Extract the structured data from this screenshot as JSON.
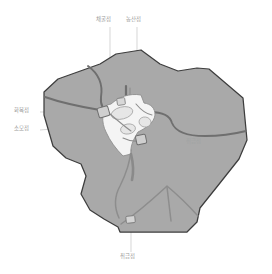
{
  "figure": {
    "type": "regional-map-diagram",
    "title": "",
    "background_color": "#ffffff"
  },
  "colors": {
    "land_fill": "#a9a9a9",
    "land_stroke": "#3d3d3d",
    "urban_fill": "#f2f2f2",
    "urban_stroke": "#8f8f8f",
    "road_major": "#6f6f6f",
    "road_minor": "#8a8a8a",
    "label_text": "#9a9a9a",
    "leader_line": "#bdbdbd"
  },
  "labels": {
    "top_left": "채굴점",
    "top_right": "농산점",
    "left_upper": "화목점",
    "left_lower": "소모점",
    "right": "취급점",
    "bottom": "취급점"
  },
  "leader_lines": [
    {
      "name": "top-left-leader",
      "from": [
        110,
        27
      ],
      "to": [
        110,
        97
      ]
    },
    {
      "name": "top-right-leader",
      "from": [
        137,
        27
      ],
      "to": [
        137,
        100
      ]
    },
    {
      "name": "left-upper-leader",
      "from": [
        40,
        112
      ],
      "to": [
        102,
        112
      ]
    },
    {
      "name": "left-lower-leader",
      "from": [
        40,
        130
      ],
      "to": [
        110,
        125
      ]
    },
    {
      "name": "right-leader",
      "from": [
        184,
        142
      ],
      "to": [
        150,
        142
      ]
    },
    {
      "name": "bottom-leader",
      "from": [
        131,
        252
      ],
      "to": [
        131,
        222
      ]
    }
  ],
  "geometry": {
    "land_outline": "M 53,146 L 44,115 L 44,92 L 58,79 L 100,64 L 116,54 L 141,50 L 160,64 L 178,71 L 197,68 L 209,69 L 243,98 L 247,140 L 239,159 L 216,188 L 200,208 L 197,222 L 187,232 L 120,232 L 118,227 L 104,219 L 90,210 L 81,194 L 86,176 L 81,164 L 66,158 Z",
    "roads_major": [
      "M 88,66 C 99,74 103,85 101,97 C 100,106 104,111 110,114",
      "M 45,97 C 62,103 82,107 99,110",
      "M 150,112 C 163,112 170,116 172,123 C 176,133 190,136 205,136 C 222,136 238,133 246,131",
      "M 126,100 L 126,86"
    ],
    "roads_minor": [
      "M 131,150 C 130,163 126,174 120,186 C 114,197 114,208 119,218",
      "M 120,223 C 140,210 155,196 167,186 C 179,196 189,206 197,215",
      "M 167,186 L 170,220"
    ],
    "urban_area": "M 110,104 C 118,97 128,94 140,95 L 143,103 C 150,104 154,108 154,114 C 153,122 146,128 138,131 C 133,139 130,147 131,153 L 123,155 C 116,148 110,140 106,131 C 101,122 101,112 106,106 Z"
  }
}
